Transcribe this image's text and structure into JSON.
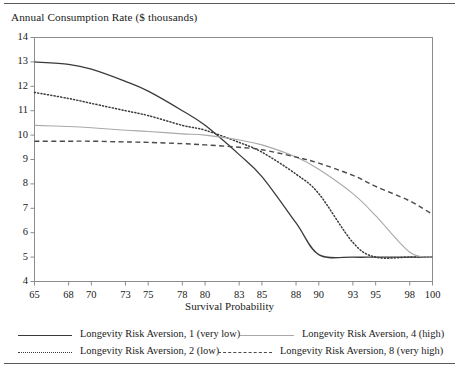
{
  "chart_data": {
    "type": "line",
    "title": "Annual Consumption Rate ($ thousands)",
    "xlabel": "Survival Probability",
    "ylabel": "",
    "xlim": [
      65,
      100
    ],
    "ylim": [
      4,
      14
    ],
    "grid": false,
    "legend_position": "bottom",
    "xticks": [
      65,
      68,
      70,
      73,
      75,
      78,
      80,
      83,
      85,
      88,
      90,
      93,
      95,
      98,
      100
    ],
    "yticks": [
      4,
      5,
      6,
      7,
      8,
      9,
      10,
      11,
      12,
      13,
      14
    ],
    "x": [
      65,
      68,
      70,
      73,
      75,
      78,
      80,
      83,
      85,
      88,
      90,
      93,
      95,
      98,
      100
    ],
    "series": [
      {
        "name": "Longevity Risk Aversion, 1 (very low)",
        "style": "solid",
        "color": "#3a3a3a",
        "values": [
          13.0,
          12.9,
          12.7,
          12.2,
          11.8,
          11.0,
          10.4,
          9.2,
          8.3,
          6.4,
          5.1,
          5.0,
          5.0,
          5.0,
          5.0
        ]
      },
      {
        "name": "Longevity Risk Aversion, 2 (low)",
        "style": "dotted",
        "color": "#3a3a3a",
        "values": [
          11.75,
          11.5,
          11.3,
          11.0,
          10.8,
          10.4,
          10.2,
          9.7,
          9.3,
          8.4,
          7.6,
          5.6,
          5.0,
          5.0,
          5.0
        ]
      },
      {
        "name": "Longevity Risk Aversion, 4 (high)",
        "style": "solid-light",
        "color": "#a9a9a9",
        "values": [
          10.4,
          10.35,
          10.3,
          10.2,
          10.15,
          10.05,
          10.0,
          9.8,
          9.6,
          9.1,
          8.6,
          7.6,
          6.7,
          5.2,
          5.0
        ]
      },
      {
        "name": "Longevity Risk Aversion, 8 (very high)",
        "style": "dashed",
        "color": "#4a4a4a",
        "values": [
          9.75,
          9.75,
          9.75,
          9.72,
          9.7,
          9.65,
          9.6,
          9.5,
          9.4,
          9.1,
          8.85,
          8.35,
          7.9,
          7.3,
          6.75
        ]
      }
    ]
  },
  "legend": {
    "entries": [
      {
        "label": "Longevity Risk Aversion, 1 (very low)",
        "style": "solid"
      },
      {
        "label": "Longevity Risk Aversion, 4 (high)",
        "style": "solid-light"
      },
      {
        "label": "Longevity Risk Aversion, 2 (low)",
        "style": "dotted"
      },
      {
        "label": "Longevity Risk Aversion, 8 (very high)",
        "style": "dashed"
      }
    ]
  }
}
